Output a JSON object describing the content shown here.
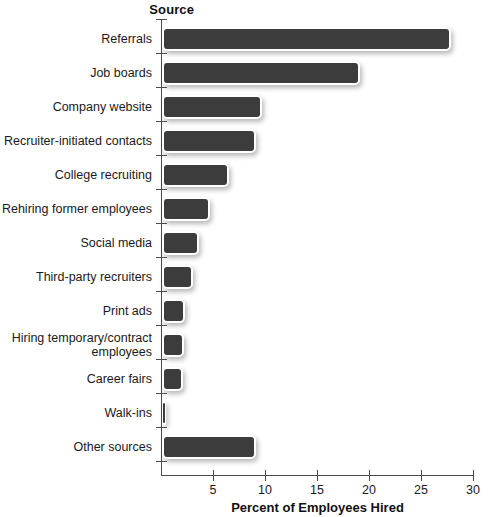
{
  "chart_data": {
    "type": "bar",
    "orientation": "horizontal",
    "title": "",
    "xlabel": "Percent of Employees Hired",
    "ylabel": "Source",
    "xlim": [
      0,
      30
    ],
    "xticks": [
      0,
      5,
      10,
      15,
      20,
      25,
      30
    ],
    "xtick_labels": [
      "",
      "5",
      "10",
      "15",
      "20",
      "25",
      "30"
    ],
    "grid": false,
    "legend": null,
    "bar_color": "#3c3c3c",
    "categories": [
      "Referrals",
      "Job boards",
      "Company website",
      "Recruiter-initiated contacts",
      "College recruiting",
      "Rehiring former employees",
      "Social media",
      "Third-party recruiters",
      "Print ads",
      "Hiring temporary/contract\nemployees",
      "Career fairs",
      "Walk-ins",
      "Other sources"
    ],
    "values": [
      27.8,
      19.0,
      9.6,
      9.0,
      6.4,
      4.6,
      3.6,
      3.0,
      2.2,
      2.1,
      2.0,
      0.4,
      9.0
    ]
  }
}
